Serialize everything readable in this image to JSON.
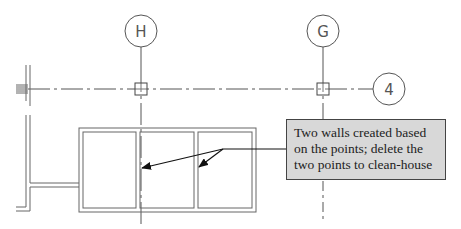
{
  "diagram": {
    "type": "architectural-plan-callout",
    "grid_bubbles": [
      {
        "label": "H",
        "cx": 141,
        "cy": 31,
        "orientation": "vertical"
      },
      {
        "label": "G",
        "cx": 323,
        "cy": 31,
        "orientation": "vertical"
      },
      {
        "label": "4",
        "cx": 389,
        "cy": 89,
        "orientation": "horizontal"
      }
    ],
    "points": [
      {
        "name": "point-at-H4",
        "x": 141,
        "y": 89
      },
      {
        "name": "point-at-G4",
        "x": 323,
        "y": 89
      }
    ],
    "callout": {
      "text": "Two walls created based on the points; delete the two points to clean-house",
      "background": "#d8d8d8",
      "arrow_targets": [
        "wall-at-grid-H",
        "wall-at-third-bay"
      ]
    },
    "colors": {
      "lines": "#555555",
      "callout_border": "#444444",
      "callout_fill": "#d8d8d8"
    }
  }
}
